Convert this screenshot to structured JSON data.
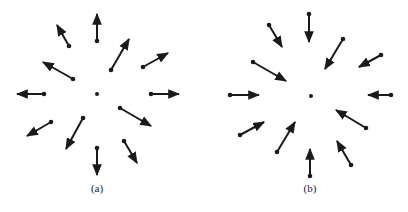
{
  "figure": {
    "panels": [
      {
        "id": "a",
        "label": "(a)",
        "label_pos": [
          97,
          192
        ],
        "description": "Vector field pointing radially outward (source)",
        "center": [
          97,
          94
        ],
        "arrows": [
          {
            "from": [
              97,
              41
            ],
            "to": [
              97,
              14
            ]
          },
          {
            "from": [
              69,
              46
            ],
            "to": [
              57,
              25
            ]
          },
          {
            "from": [
              111,
              70
            ],
            "to": [
              129,
              39
            ]
          },
          {
            "from": [
              143,
              67
            ],
            "to": [
              168,
              53
            ]
          },
          {
            "from": [
              73,
              79
            ],
            "to": [
              43,
              62
            ]
          },
          {
            "from": [
              44,
              94
            ],
            "to": [
              17,
              94
            ]
          },
          {
            "from": [
              151,
              94
            ],
            "to": [
              179,
              94
            ]
          },
          {
            "from": [
              120,
              108
            ],
            "to": [
              151,
              126
            ]
          },
          {
            "from": [
              51,
              122
            ],
            "to": [
              27,
              136
            ]
          },
          {
            "from": [
              83,
              118
            ],
            "to": [
              66,
              149
            ]
          },
          {
            "from": [
              97,
              148
            ],
            "to": [
              97,
              175
            ]
          },
          {
            "from": [
              124,
              141
            ],
            "to": [
              137,
              163
            ]
          }
        ]
      },
      {
        "id": "b",
        "label": "(b)",
        "label_pos": [
          310,
          192
        ],
        "description": "Vector field pointing radially inward (sink)",
        "center": [
          311,
          96
        ],
        "arrows": [
          {
            "from": [
              309,
              14
            ],
            "to": [
              309,
              42
            ]
          },
          {
            "from": [
              269,
              25
            ],
            "to": [
              282,
              47
            ]
          },
          {
            "from": [
              343,
              39
            ],
            "to": [
              325,
              69
            ]
          },
          {
            "from": [
              381,
              55
            ],
            "to": [
              359,
              67
            ]
          },
          {
            "from": [
              253,
              62
            ],
            "to": [
              286,
              81
            ]
          },
          {
            "from": [
              230,
              95
            ],
            "to": [
              259,
              95
            ]
          },
          {
            "from": [
              391,
              95
            ],
            "to": [
              368,
              95
            ]
          },
          {
            "from": [
              366,
              128
            ],
            "to": [
              336,
              110
            ]
          },
          {
            "from": [
              240,
              135
            ],
            "to": [
              264,
              122
            ]
          },
          {
            "from": [
              277,
              152
            ],
            "to": [
              295,
              122
            ]
          },
          {
            "from": [
              310,
              176
            ],
            "to": [
              310,
              149
            ]
          },
          {
            "from": [
              351,
              165
            ],
            "to": [
              337,
              141
            ]
          }
        ]
      }
    ],
    "colors": {
      "ink": "#1a1a1a",
      "background": "#ffffff"
    }
  }
}
